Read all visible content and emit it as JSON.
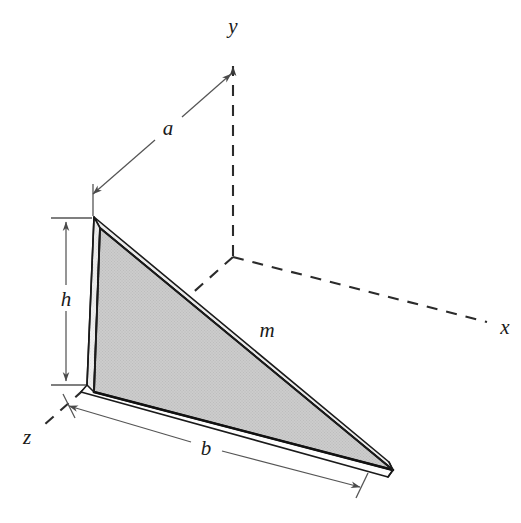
{
  "figure": {
    "background_color": "#ffffff",
    "line_color": "#1a1a1a",
    "dimension_line_color": "#555555",
    "face_front_color": "#c9c9c9",
    "face_top_color": "#e6e6e6",
    "face_bottom_color": "#fbfbfb"
  },
  "axes": {
    "style": "dashed",
    "origin_label": "",
    "labels": {
      "y": "y",
      "x": "x",
      "z": "z"
    }
  },
  "dimensions": [
    {
      "key": "a",
      "label": "a",
      "kind": "double-arrow",
      "description": "distance from wedge top apex to y-axis"
    },
    {
      "key": "h",
      "label": "h",
      "kind": "double-arrow",
      "description": "height of the vertical left face"
    },
    {
      "key": "b",
      "label": "b",
      "kind": "double-arrow",
      "description": "length of the bottom edge"
    }
  ],
  "body": {
    "mass_label": "m",
    "shape": "triangular wedge plate"
  }
}
